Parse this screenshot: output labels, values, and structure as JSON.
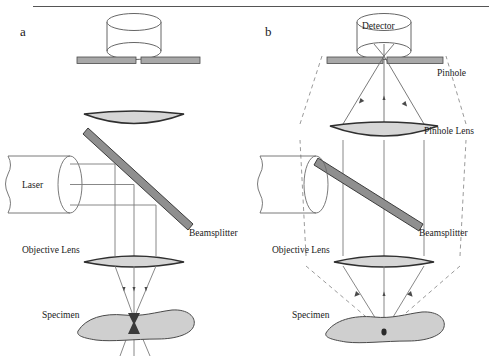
{
  "figure": {
    "panels": [
      {
        "id": "a",
        "label": "a",
        "caption": "Illumination path",
        "labels": {
          "source": "Laser",
          "beamsplitter": "Beamsplitter",
          "objective_lens": "Objective Lens",
          "specimen": "Specimen"
        }
      },
      {
        "id": "b",
        "label": "b",
        "caption": "Detection path",
        "labels": {
          "detector": "Detector",
          "pinhole": "Pinhole",
          "pinhole_lens": "Pinhole Lens",
          "beamsplitter": "Beamsplitter",
          "objective_lens": "Objective Lens",
          "specimen": "Specimen"
        }
      }
    ],
    "colors": {
      "outline": "#3f3f3f",
      "ray_solid": "#6b6b6b",
      "ray_dashed": "#8a8a8a",
      "fill_gray": "#d2d2d2",
      "fill_bar": "#a0a0a0",
      "bar_edge": "#4a4a4a",
      "text": "#1a1a1a",
      "rule": "#555555",
      "focus": "#2a2a2a"
    }
  }
}
